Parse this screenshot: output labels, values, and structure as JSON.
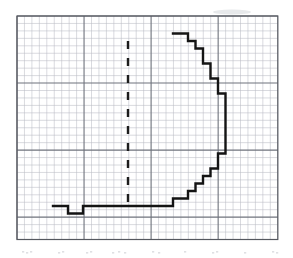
{
  "figure": {
    "title": "",
    "media": "scanned-graph-paper",
    "background_color": "#ffffff",
    "grid": {
      "minor_color": "#b9bcc4",
      "major_color": "#6f737c",
      "border_color": "#55585f",
      "cell_size_px": 7.45,
      "minor_line_width": 0.55,
      "major_line_width": 1.1,
      "major_every_n_cells": 9,
      "origin_x": 17.0,
      "origin_y": 16.0,
      "columns": 35,
      "rows": 30,
      "plot_left": 17.0,
      "plot_top": 16.0,
      "plot_right": 277.8,
      "plot_bottom": 239.5
    },
    "curve": {
      "label": "stepped-half-disk-outline",
      "color": "#141414",
      "stroke_width": 2.4,
      "description": "Closed stepped staircase outline of a right half-disk, open at the left, flat base at the bottom",
      "points": [
        [
          173.0,
          33.5
        ],
        [
          188.0,
          33.5
        ],
        [
          188.0,
          41.0
        ],
        [
          195.5,
          41.0
        ],
        [
          195.5,
          48.5
        ],
        [
          203.0,
          48.5
        ],
        [
          203.0,
          56.0
        ],
        [
          203.0,
          63.5
        ],
        [
          210.5,
          63.5
        ],
        [
          210.5,
          71.0
        ],
        [
          210.5,
          78.5
        ],
        [
          218.0,
          78.5
        ],
        [
          218.0,
          86.0
        ],
        [
          218.0,
          93.5
        ],
        [
          225.5,
          93.5
        ],
        [
          225.5,
          101.0
        ],
        [
          225.5,
          116.0
        ],
        [
          225.5,
          131.0
        ],
        [
          225.5,
          146.0
        ],
        [
          225.5,
          153.5
        ],
        [
          218.0,
          153.5
        ],
        [
          218.0,
          161.0
        ],
        [
          218.0,
          168.5
        ],
        [
          210.5,
          168.5
        ],
        [
          210.5,
          176.0
        ],
        [
          203.0,
          176.0
        ],
        [
          203.0,
          183.5
        ],
        [
          195.5,
          183.5
        ],
        [
          195.5,
          191.0
        ],
        [
          188.0,
          191.0
        ],
        [
          188.0,
          198.5
        ],
        [
          173.0,
          198.5
        ],
        [
          173.0,
          206.0
        ],
        [
          143.0,
          206.0
        ],
        [
          128.0,
          206.0
        ],
        [
          113.0,
          206.0
        ],
        [
          98.0,
          206.0
        ],
        [
          83.0,
          206.0
        ],
        [
          83.0,
          213.5
        ],
        [
          68.0,
          213.5
        ],
        [
          68.0,
          213.5
        ],
        [
          68.0,
          206.0
        ],
        [
          53.0,
          206.0
        ]
      ]
    },
    "axis_line": {
      "label": "dashed-symmetry-axis",
      "color": "#1c1c1c",
      "stroke_width": 2.4,
      "orientation": "vertical",
      "x": 128.0,
      "y_top": 41.0,
      "y_bottom": 210.0,
      "dash_pattern": "8 9"
    },
    "scan_artifacts": {
      "smudge_color": "#cfd2d6",
      "bottom_noise_color": "#bfc2c8"
    }
  }
}
